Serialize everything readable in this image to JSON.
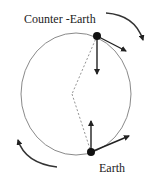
{
  "diagram": {
    "labels": {
      "counter_earth": "Counter -Earth",
      "earth": "Earth"
    },
    "colors": {
      "orbit": "#8a8a8a",
      "arrows": "#222222",
      "bodies": "#111111",
      "dashed": "#777777"
    }
  }
}
